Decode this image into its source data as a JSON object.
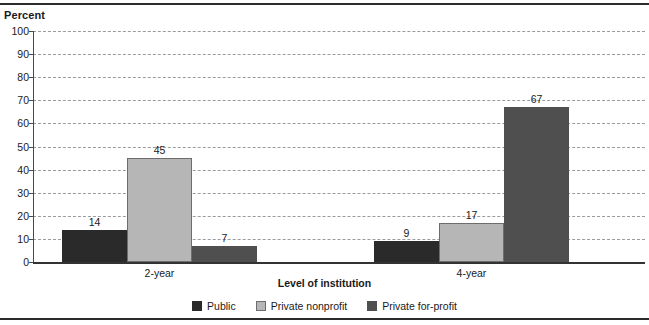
{
  "chart_data": {
    "type": "bar",
    "title": "",
    "xlabel": "Level of institution",
    "ylabel": "Percent",
    "ylim": [
      0,
      100
    ],
    "yticks": [
      100,
      90,
      80,
      70,
      60,
      50,
      40,
      30,
      20,
      10,
      0
    ],
    "grid": true,
    "legend_position": "bottom",
    "categories": [
      "2-year",
      "4-year"
    ],
    "series": [
      {
        "name": "Public",
        "values": [
          14,
          9
        ],
        "color": "#2a2a2a"
      },
      {
        "name": "Private nonprofit",
        "values": [
          45,
          17
        ],
        "color": "#b6b6b6"
      },
      {
        "name": "Private for-profit",
        "values": [
          7,
          67
        ],
        "color": "#4f4f4f"
      }
    ],
    "bars": [
      {
        "group": "2-year",
        "series": "Public",
        "value": 14,
        "label": "14"
      },
      {
        "group": "2-year",
        "series": "Private nonprofit",
        "value": 45,
        "label": "45"
      },
      {
        "group": "2-year",
        "series": "Private for-profit",
        "value": 7,
        "label": "7"
      },
      {
        "group": "4-year",
        "series": "Public",
        "value": 9,
        "label": "9"
      },
      {
        "group": "4-year",
        "series": "Private nonprofit",
        "value": 17,
        "label": "17"
      },
      {
        "group": "4-year",
        "series": "Private for-profit",
        "value": 67,
        "label": "67"
      }
    ]
  },
  "axes": {
    "y_title": "Percent",
    "x_title": "Level of institution",
    "tick_labels": [
      "100",
      "90",
      "80",
      "70",
      "60",
      "50",
      "40",
      "30",
      "20",
      "10",
      "0"
    ]
  },
  "group_labels": [
    "2-year",
    "4-year"
  ],
  "legend": {
    "items": [
      {
        "label": "Public",
        "swatch": "public"
      },
      {
        "label": "Private nonprofit",
        "swatch": "nonprofit"
      },
      {
        "label": "Private for-profit",
        "swatch": "forprofit"
      }
    ]
  },
  "bar_values": [
    "14",
    "45",
    "7",
    "9",
    "17",
    "67"
  ]
}
